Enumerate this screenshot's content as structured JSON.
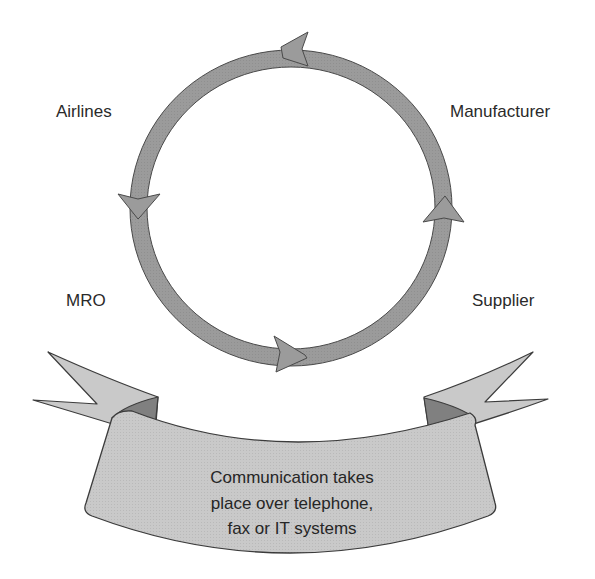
{
  "diagram": {
    "nodes": [
      {
        "id": "airlines",
        "label": "Airlines"
      },
      {
        "id": "manufacturer",
        "label": "Manufacturer"
      },
      {
        "id": "mro",
        "label": "MRO"
      },
      {
        "id": "supplier",
        "label": "Supplier"
      }
    ],
    "cycle": {
      "shape": "ring",
      "direction": "counterclockwise",
      "arrowheads": [
        "top-pointing-left",
        "left-pointing-down",
        "bottom-pointing-right",
        "right-pointing-up"
      ]
    },
    "banner": {
      "lines": [
        "Communication takes",
        "place over telephone,",
        "fax or IT systems"
      ]
    },
    "colors": {
      "ring_fill": "#9b9b9b",
      "banner_fill": "#c9c9c9",
      "banner_fold": "#808080",
      "outline": "#4a4a4a",
      "text": "#262626"
    }
  }
}
